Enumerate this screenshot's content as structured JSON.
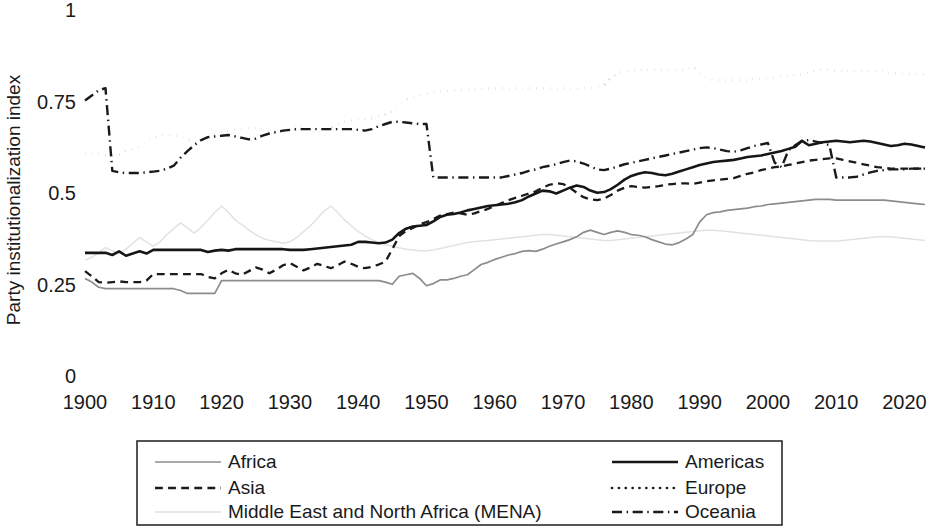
{
  "chart_data": {
    "type": "line",
    "title": "",
    "xlabel": "",
    "ylabel": "Party institutionalization index",
    "xlim": [
      1900,
      2023
    ],
    "ylim": [
      0,
      1
    ],
    "grid": false,
    "legend_position": "bottom",
    "yticks": [
      "0",
      "0.25",
      "0.5",
      "0.75",
      "1"
    ],
    "ytick_values": [
      0,
      0.25,
      0.5,
      0.75,
      1
    ],
    "xticks": [
      "1900",
      "1910",
      "1920",
      "1930",
      "1940",
      "1950",
      "1960",
      "1970",
      "1980",
      "1990",
      "2000",
      "2010",
      "2020"
    ],
    "xtick_values": [
      1900,
      1910,
      1920,
      1930,
      1940,
      1950,
      1960,
      1970,
      1980,
      1990,
      2000,
      2010,
      2020
    ],
    "x": [
      1900,
      1901,
      1902,
      1903,
      1904,
      1905,
      1906,
      1907,
      1908,
      1909,
      1910,
      1911,
      1912,
      1913,
      1914,
      1915,
      1916,
      1917,
      1918,
      1919,
      1920,
      1921,
      1922,
      1923,
      1924,
      1925,
      1926,
      1927,
      1928,
      1929,
      1930,
      1931,
      1932,
      1933,
      1934,
      1935,
      1936,
      1937,
      1938,
      1939,
      1940,
      1941,
      1942,
      1943,
      1944,
      1945,
      1946,
      1947,
      1948,
      1949,
      1950,
      1951,
      1952,
      1953,
      1954,
      1955,
      1956,
      1957,
      1958,
      1959,
      1960,
      1961,
      1962,
      1963,
      1964,
      1965,
      1966,
      1967,
      1968,
      1969,
      1970,
      1971,
      1972,
      1973,
      1974,
      1975,
      1976,
      1977,
      1978,
      1979,
      1980,
      1981,
      1982,
      1983,
      1984,
      1985,
      1986,
      1987,
      1988,
      1989,
      1990,
      1991,
      1992,
      1993,
      1994,
      1995,
      1996,
      1997,
      1998,
      1999,
      2000,
      2001,
      2002,
      2003,
      2004,
      2005,
      2006,
      2007,
      2008,
      2009,
      2010,
      2011,
      2012,
      2013,
      2014,
      2015,
      2016,
      2017,
      2018,
      2019,
      2020,
      2021,
      2022,
      2023
    ],
    "series": [
      {
        "name": "Africa",
        "style": "solid",
        "color": "#8c8c8c",
        "width": 1.7,
        "values": [
          0.272,
          0.262,
          0.248,
          0.244,
          0.244,
          0.244,
          0.244,
          0.244,
          0.244,
          0.244,
          0.244,
          0.244,
          0.244,
          0.244,
          0.239,
          0.231,
          0.231,
          0.231,
          0.231,
          0.231,
          0.266,
          0.266,
          0.266,
          0.266,
          0.266,
          0.266,
          0.266,
          0.266,
          0.266,
          0.266,
          0.266,
          0.266,
          0.266,
          0.266,
          0.266,
          0.266,
          0.266,
          0.266,
          0.266,
          0.266,
          0.266,
          0.266,
          0.266,
          0.266,
          0.262,
          0.256,
          0.278,
          0.282,
          0.286,
          0.272,
          0.252,
          0.258,
          0.268,
          0.268,
          0.272,
          0.278,
          0.282,
          0.296,
          0.31,
          0.316,
          0.324,
          0.33,
          0.336,
          0.34,
          0.346,
          0.348,
          0.346,
          0.352,
          0.36,
          0.366,
          0.372,
          0.378,
          0.386,
          0.398,
          0.404,
          0.398,
          0.392,
          0.398,
          0.402,
          0.398,
          0.392,
          0.39,
          0.386,
          0.378,
          0.372,
          0.366,
          0.364,
          0.37,
          0.38,
          0.392,
          0.426,
          0.446,
          0.452,
          0.454,
          0.458,
          0.46,
          0.462,
          0.464,
          0.468,
          0.47,
          0.474,
          0.476,
          0.478,
          0.48,
          0.482,
          0.484,
          0.486,
          0.488,
          0.488,
          0.488,
          0.486,
          0.486,
          0.486,
          0.486,
          0.486,
          0.486,
          0.486,
          0.486,
          0.484,
          0.482,
          0.48,
          0.478,
          0.476,
          0.474
        ]
      },
      {
        "name": "Asia",
        "style": "dashed",
        "color": "#1a1a1a",
        "width": 2.3,
        "values": [
          0.292,
          0.278,
          0.262,
          0.26,
          0.262,
          0.264,
          0.262,
          0.262,
          0.262,
          0.266,
          0.284,
          0.284,
          0.284,
          0.284,
          0.284,
          0.284,
          0.284,
          0.284,
          0.276,
          0.272,
          0.286,
          0.296,
          0.286,
          0.282,
          0.292,
          0.302,
          0.296,
          0.286,
          0.296,
          0.308,
          0.314,
          0.304,
          0.294,
          0.302,
          0.312,
          0.306,
          0.3,
          0.308,
          0.318,
          0.312,
          0.304,
          0.3,
          0.304,
          0.31,
          0.318,
          0.352,
          0.388,
          0.402,
          0.41,
          0.42,
          0.426,
          0.434,
          0.444,
          0.448,
          0.452,
          0.45,
          0.446,
          0.45,
          0.456,
          0.462,
          0.47,
          0.478,
          0.486,
          0.492,
          0.498,
          0.504,
          0.51,
          0.52,
          0.528,
          0.532,
          0.53,
          0.52,
          0.506,
          0.494,
          0.488,
          0.486,
          0.49,
          0.5,
          0.512,
          0.52,
          0.524,
          0.522,
          0.52,
          0.522,
          0.524,
          0.528,
          0.53,
          0.532,
          0.532,
          0.53,
          0.534,
          0.538,
          0.54,
          0.542,
          0.544,
          0.546,
          0.552,
          0.558,
          0.562,
          0.568,
          0.572,
          0.576,
          0.578,
          0.582,
          0.586,
          0.59,
          0.594,
          0.596,
          0.598,
          0.6,
          0.6,
          0.596,
          0.592,
          0.588,
          0.584,
          0.58,
          0.576,
          0.574,
          0.572,
          0.572,
          0.572,
          0.572,
          0.572,
          0.572
        ]
      },
      {
        "name": "Middle East and North Africa (MENA)",
        "style": "solid",
        "color": "#e2e2e2",
        "width": 1.5,
        "values": [
          0.322,
          0.33,
          0.342,
          0.356,
          0.348,
          0.34,
          0.352,
          0.368,
          0.384,
          0.372,
          0.36,
          0.372,
          0.392,
          0.408,
          0.424,
          0.41,
          0.396,
          0.412,
          0.432,
          0.452,
          0.47,
          0.452,
          0.432,
          0.418,
          0.404,
          0.392,
          0.382,
          0.376,
          0.372,
          0.368,
          0.372,
          0.384,
          0.4,
          0.416,
          0.436,
          0.456,
          0.47,
          0.452,
          0.432,
          0.416,
          0.4,
          0.388,
          0.378,
          0.37,
          0.364,
          0.36,
          0.356,
          0.352,
          0.35,
          0.348,
          0.348,
          0.35,
          0.354,
          0.358,
          0.362,
          0.366,
          0.37,
          0.372,
          0.374,
          0.376,
          0.378,
          0.38,
          0.382,
          0.384,
          0.386,
          0.388,
          0.39,
          0.392,
          0.392,
          0.39,
          0.388,
          0.386,
          0.384,
          0.382,
          0.38,
          0.378,
          0.376,
          0.376,
          0.378,
          0.38,
          0.382,
          0.384,
          0.386,
          0.388,
          0.39,
          0.392,
          0.394,
          0.396,
          0.398,
          0.4,
          0.402,
          0.404,
          0.404,
          0.402,
          0.4,
          0.398,
          0.396,
          0.394,
          0.392,
          0.39,
          0.388,
          0.386,
          0.384,
          0.382,
          0.38,
          0.378,
          0.376,
          0.374,
          0.374,
          0.374,
          0.374,
          0.376,
          0.378,
          0.38,
          0.382,
          0.384,
          0.386,
          0.386,
          0.386,
          0.384,
          0.382,
          0.38,
          0.378,
          0.376
        ]
      },
      {
        "name": "Americas",
        "style": "solid",
        "color": "#161616",
        "width": 2.6,
        "values": [
          0.342,
          0.342,
          0.342,
          0.342,
          0.336,
          0.346,
          0.334,
          0.34,
          0.346,
          0.34,
          0.35,
          0.35,
          0.35,
          0.35,
          0.35,
          0.35,
          0.35,
          0.35,
          0.344,
          0.348,
          0.35,
          0.348,
          0.352,
          0.352,
          0.352,
          0.352,
          0.352,
          0.352,
          0.352,
          0.352,
          0.35,
          0.35,
          0.35,
          0.352,
          0.354,
          0.356,
          0.358,
          0.36,
          0.362,
          0.364,
          0.372,
          0.372,
          0.37,
          0.368,
          0.37,
          0.378,
          0.396,
          0.408,
          0.414,
          0.416,
          0.418,
          0.428,
          0.44,
          0.446,
          0.448,
          0.452,
          0.458,
          0.462,
          0.466,
          0.47,
          0.472,
          0.474,
          0.476,
          0.48,
          0.486,
          0.496,
          0.504,
          0.512,
          0.51,
          0.504,
          0.512,
          0.52,
          0.526,
          0.522,
          0.512,
          0.506,
          0.508,
          0.516,
          0.528,
          0.542,
          0.552,
          0.558,
          0.562,
          0.56,
          0.556,
          0.554,
          0.558,
          0.564,
          0.57,
          0.576,
          0.582,
          0.586,
          0.59,
          0.592,
          0.594,
          0.596,
          0.6,
          0.604,
          0.606,
          0.608,
          0.612,
          0.616,
          0.62,
          0.626,
          0.632,
          0.648,
          0.636,
          0.64,
          0.644,
          0.646,
          0.648,
          0.646,
          0.644,
          0.646,
          0.648,
          0.646,
          0.642,
          0.638,
          0.634,
          0.636,
          0.64,
          0.638,
          0.634,
          0.63
        ]
      },
      {
        "name": "Europe",
        "style": "dotted",
        "color": "#1a1a1a",
        "width": 2.6,
        "values": [
          0.612,
          0.612,
          0.612,
          0.61,
          0.608,
          0.612,
          0.62,
          0.626,
          0.632,
          0.646,
          0.656,
          0.664,
          0.664,
          0.662,
          0.66,
          0.65,
          0.644,
          0.648,
          0.658,
          0.666,
          0.672,
          0.676,
          0.678,
          0.68,
          0.682,
          0.684,
          0.68,
          0.674,
          0.67,
          0.676,
          0.684,
          0.69,
          0.686,
          0.676,
          0.668,
          0.672,
          0.684,
          0.694,
          0.7,
          0.704,
          0.708,
          0.708,
          0.71,
          0.714,
          0.72,
          0.73,
          0.748,
          0.76,
          0.766,
          0.772,
          0.776,
          0.78,
          0.782,
          0.784,
          0.786,
          0.786,
          0.788,
          0.788,
          0.79,
          0.79,
          0.792,
          0.792,
          0.792,
          0.792,
          0.792,
          0.792,
          0.792,
          0.792,
          0.792,
          0.792,
          0.792,
          0.792,
          0.79,
          0.792,
          0.794,
          0.796,
          0.8,
          0.82,
          0.834,
          0.838,
          0.84,
          0.842,
          0.842,
          0.842,
          0.842,
          0.842,
          0.842,
          0.842,
          0.842,
          0.85,
          0.836,
          0.822,
          0.814,
          0.814,
          0.814,
          0.814,
          0.814,
          0.814,
          0.816,
          0.818,
          0.82,
          0.822,
          0.824,
          0.826,
          0.828,
          0.83,
          0.834,
          0.84,
          0.844,
          0.842,
          0.838,
          0.838,
          0.838,
          0.838,
          0.838,
          0.838,
          0.838,
          0.836,
          0.834,
          0.832,
          0.83,
          0.83,
          0.83,
          0.83
        ]
      },
      {
        "name": "Oceania",
        "style": "dashdot",
        "color": "#1a1a1a",
        "width": 2.4,
        "values": [
          0.758,
          0.772,
          0.786,
          0.792,
          0.566,
          0.562,
          0.56,
          0.56,
          0.56,
          0.562,
          0.564,
          0.566,
          0.572,
          0.58,
          0.602,
          0.62,
          0.636,
          0.65,
          0.658,
          0.66,
          0.662,
          0.664,
          0.66,
          0.656,
          0.652,
          0.654,
          0.662,
          0.668,
          0.672,
          0.676,
          0.678,
          0.68,
          0.68,
          0.68,
          0.68,
          0.68,
          0.68,
          0.68,
          0.68,
          0.68,
          0.678,
          0.676,
          0.68,
          0.688,
          0.694,
          0.7,
          0.7,
          0.698,
          0.696,
          0.694,
          0.694,
          0.548,
          0.548,
          0.548,
          0.548,
          0.548,
          0.548,
          0.548,
          0.548,
          0.548,
          0.548,
          0.548,
          0.552,
          0.556,
          0.56,
          0.566,
          0.57,
          0.576,
          0.58,
          0.584,
          0.59,
          0.594,
          0.592,
          0.586,
          0.578,
          0.57,
          0.568,
          0.572,
          0.578,
          0.584,
          0.588,
          0.592,
          0.596,
          0.6,
          0.604,
          0.608,
          0.612,
          0.616,
          0.62,
          0.624,
          0.628,
          0.63,
          0.628,
          0.624,
          0.62,
          0.618,
          0.622,
          0.628,
          0.634,
          0.638,
          0.642,
          0.588,
          0.576,
          0.622,
          0.636,
          0.648,
          0.65,
          0.646,
          0.642,
          0.636,
          0.548,
          0.548,
          0.548,
          0.55,
          0.556,
          0.562,
          0.566,
          0.568,
          0.57,
          0.57,
          0.57,
          0.572,
          0.572,
          0.572
        ]
      }
    ],
    "legend": [
      {
        "label": "Africa",
        "style": "solid",
        "color": "#8c8c8c",
        "width": 1.7,
        "column": "left",
        "row": 0
      },
      {
        "label": "Asia",
        "style": "dashed",
        "color": "#1a1a1a",
        "width": 2.3,
        "column": "left",
        "row": 1
      },
      {
        "label": "Middle East and North Africa (MENA)",
        "style": "solid",
        "color": "#e2e2e2",
        "width": 1.5,
        "column": "left",
        "row": 2
      },
      {
        "label": "Americas",
        "style": "solid",
        "color": "#161616",
        "width": 2.6,
        "column": "right",
        "row": 0
      },
      {
        "label": "Europe",
        "style": "dotted",
        "color": "#1a1a1a",
        "width": 2.6,
        "column": "right",
        "row": 1
      },
      {
        "label": "Oceania",
        "style": "dashdot",
        "color": "#1a1a1a",
        "width": 2.4,
        "column": "right",
        "row": 2
      }
    ]
  }
}
